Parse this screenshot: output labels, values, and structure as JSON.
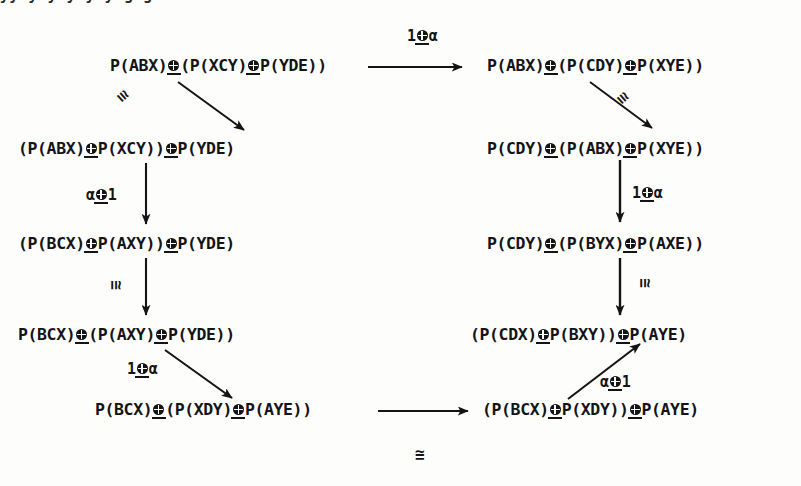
{
  "diagram": {
    "tensor_symbol": "⊗",
    "congruence_symbol": "≅",
    "ink_color": "#141417",
    "background_color": "#fdfdfc",
    "cropped_top_line": "yy y y y y  y     g   g",
    "nodes": [
      {
        "id": "n-top-left",
        "parts": [
          "P(ABX)",
          "(P(XCY)",
          "P(YDE))"
        ],
        "text": "P(ABX)⊗(P(XCY)⊗P(YDE))"
      },
      {
        "id": "n-top-right",
        "parts": [
          "P(ABX)",
          "(P(CDY)",
          "P(XYE))"
        ],
        "text": "P(ABX)⊗(P(CDY)⊗P(XYE))"
      },
      {
        "id": "n-left-2",
        "parts": [
          "(P(ABX)",
          "P(XCY))",
          "P(YDE)"
        ],
        "text": "(P(ABX)⊗P(XCY))⊗P(YDE)"
      },
      {
        "id": "n-right-2",
        "parts": [
          "P(CDY)",
          "(P(ABX)",
          "P(XYE))"
        ],
        "text": "P(CDY)⊗(P(ABX)⊗P(XYE))"
      },
      {
        "id": "n-left-3",
        "parts": [
          "(P(BCX)",
          "P(AXY))",
          "P(YDE)"
        ],
        "text": "(P(BCX)⊗P(AXY))⊗P(YDE)"
      },
      {
        "id": "n-right-3",
        "parts": [
          "P(CDY)",
          "(P(BYX)",
          "P(AXE))"
        ],
        "text": "P(CDY)⊗(P(BYX)⊗P(AXE))"
      },
      {
        "id": "n-left-4",
        "parts": [
          "P(BCX)",
          "(P(AXY)",
          "P(YDE))"
        ],
        "text": "P(BCX)⊗(P(AXY)⊗P(YDE))"
      },
      {
        "id": "n-right-4",
        "parts": [
          "(P(CDX)",
          "P(BXY))",
          "P(AYE)"
        ],
        "text": "(P(CDX)⊗P(BXY))⊗P(AYE)"
      },
      {
        "id": "n-bottom-left",
        "parts": [
          "P(BCX)",
          "(P(XDY)",
          "P(AYE))"
        ],
        "text": "P(BCX)⊗(P(XDY)⊗P(AYE))"
      },
      {
        "id": "n-bottom-right",
        "parts": [
          "(P(BCX)",
          "P(XDY))",
          "P(AYE)"
        ],
        "text": "(P(BCX)⊗P(XDY))⊗P(AYE)"
      }
    ],
    "labels": [
      {
        "id": "lbl-top",
        "left": "1",
        "right": "α",
        "text": "1⊗α"
      },
      {
        "id": "lbl-left-alpha1",
        "left": "α",
        "right": "1",
        "text": "α⊗1"
      },
      {
        "id": "lbl-left-1alpha",
        "left": "1",
        "right": "α",
        "text": "1⊗α"
      },
      {
        "id": "lbl-right-1alpha",
        "left": "1",
        "right": "α",
        "text": "1⊗α"
      },
      {
        "id": "lbl-right-alpha1",
        "left": "α",
        "right": "1",
        "text": "α⊗1"
      }
    ],
    "congruences": [
      {
        "id": "cong-top-left-diag",
        "text": "≅"
      },
      {
        "id": "cong-top-right-diag",
        "text": "≅"
      },
      {
        "id": "cong-left-vertical",
        "text": "≅"
      },
      {
        "id": "cong-right-vertical",
        "text": "≅"
      },
      {
        "id": "cong-bottom",
        "text": "≅"
      }
    ]
  }
}
